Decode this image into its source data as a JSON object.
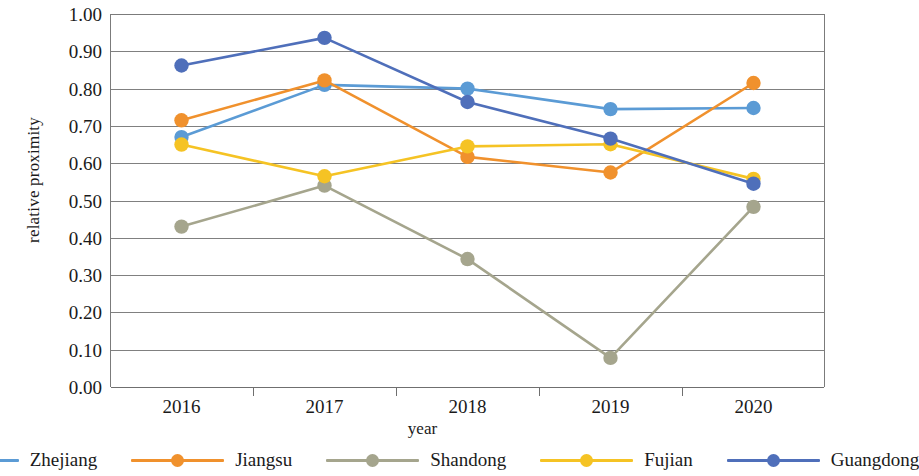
{
  "chart_data": {
    "type": "line",
    "title": "",
    "xlabel": "year",
    "ylabel": "relative proximity",
    "categories": [
      "2016",
      "2017",
      "2018",
      "2019",
      "2020"
    ],
    "x": [
      2016,
      2017,
      2018,
      2019,
      2020
    ],
    "ylim": [
      0.0,
      1.0
    ],
    "ytick_labels": [
      "1.00",
      "0.90",
      "0.80",
      "0.70",
      "0.60",
      "0.50",
      "0.40",
      "0.30",
      "0.20",
      "0.10",
      "0.00"
    ],
    "ytick_values": [
      1.0,
      0.9,
      0.8,
      0.7,
      0.6,
      0.5,
      0.4,
      0.3,
      0.2,
      0.1,
      0.0
    ],
    "grid": true,
    "legend_position": "bottom",
    "markers": "circle",
    "series": [
      {
        "name": "Zhejiang",
        "color": "#5b9bd5",
        "values": [
          0.67,
          0.81,
          0.8,
          0.745,
          0.748
        ]
      },
      {
        "name": "Jiangsu",
        "color": "#f0912d",
        "values": [
          0.715,
          0.822,
          0.617,
          0.575,
          0.815
        ]
      },
      {
        "name": "Shandong",
        "color": "#a5a58d",
        "values": [
          0.43,
          0.54,
          0.343,
          0.078,
          0.483
        ]
      },
      {
        "name": "Fujian",
        "color": "#f5c324",
        "values": [
          0.65,
          0.565,
          0.645,
          0.651,
          0.558
        ]
      },
      {
        "name": "Guangdong",
        "color": "#4f6fba",
        "values": [
          0.862,
          0.936,
          0.764,
          0.666,
          0.545
        ]
      }
    ]
  },
  "legend": {
    "items": [
      {
        "label": "Zhejiang"
      },
      {
        "label": "Jiangsu"
      },
      {
        "label": "Shandong"
      },
      {
        "label": "Fujian"
      },
      {
        "label": "Guangdong"
      }
    ]
  }
}
